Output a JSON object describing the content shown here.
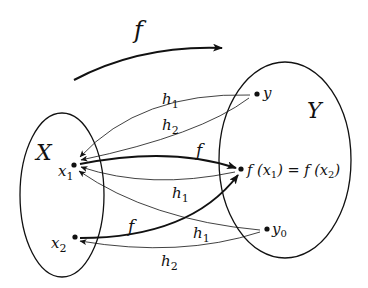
{
  "diagram": {
    "title_map_label": "f",
    "sets": [
      {
        "id": "X",
        "label": "X"
      },
      {
        "id": "Y",
        "label": "Y"
      }
    ],
    "points": {
      "x1": {
        "name": "x",
        "sub": "1"
      },
      "x2": {
        "name": "x",
        "sub": "2"
      },
      "y": {
        "name": "y"
      },
      "y0": {
        "name": "y",
        "sub": "0"
      },
      "fx": {
        "text": "f (x",
        "sub1": "1",
        "mid": ") = f (x",
        "sub2": "2",
        "end": ")"
      }
    },
    "edges": [
      {
        "from": "x1",
        "to": "f(x1)",
        "label": "f",
        "style": "bold"
      },
      {
        "from": "x2",
        "to": "f(x2)",
        "label": "f",
        "style": "bold"
      },
      {
        "from": "y",
        "to": "x1",
        "label": "h",
        "label_sub": "1",
        "style": "thin"
      },
      {
        "from": "y",
        "to": "x1",
        "label": "h",
        "label_sub": "2",
        "style": "thin"
      },
      {
        "from": "f(x1)",
        "to": "x1",
        "label": "h",
        "label_sub": "1",
        "style": "thin"
      },
      {
        "from": "y0",
        "to": "x1",
        "label": "h",
        "label_sub": "1",
        "style": "thin"
      },
      {
        "from": "y0",
        "to": "x2",
        "label": "h",
        "label_sub": "2",
        "style": "thin"
      }
    ],
    "colors": {
      "stroke": "#111111",
      "background": "#ffffff"
    }
  }
}
